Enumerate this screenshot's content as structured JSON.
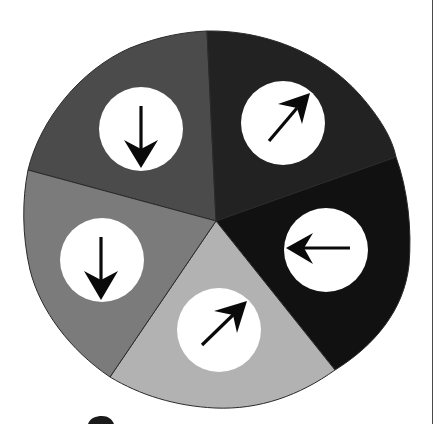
{
  "diagram": {
    "type": "pie-with-arrows",
    "sector_count": 5,
    "outline_color": "#2a2a2a",
    "circle_fill": "#ffffff",
    "arrow_color": "#0a0a0a",
    "sectors": [
      {
        "id": "upper-left",
        "fill": "#4b4b4b",
        "arrow_direction": "down",
        "arrow_icon": "arrow-down-icon"
      },
      {
        "id": "upper-right",
        "fill": "#222222",
        "arrow_direction": "up-right",
        "arrow_icon": "arrow-up-right-icon"
      },
      {
        "id": "right",
        "fill": "#111111",
        "arrow_direction": "left",
        "arrow_icon": "arrow-left-icon"
      },
      {
        "id": "bottom",
        "fill": "#b2b2b2",
        "arrow_direction": "up-right",
        "arrow_icon": "arrow-up-right-icon"
      },
      {
        "id": "left",
        "fill": "#7b7b7b",
        "arrow_direction": "down",
        "arrow_icon": "arrow-down-icon"
      }
    ]
  },
  "frame": {
    "right_rule_color": "#4a4a4a"
  }
}
